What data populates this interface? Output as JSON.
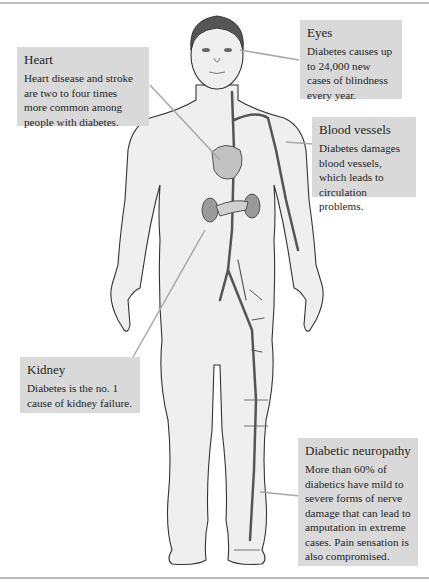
{
  "diagram": {
    "callouts": [
      {
        "id": "heart",
        "title": "Heart",
        "body": "Heart disease and stroke are two to four times more common among people with diabetes."
      },
      {
        "id": "eyes",
        "title": "Eyes",
        "body": "Diabetes causes up to 24,000 new cases of blindness every year."
      },
      {
        "id": "blood_vessels",
        "title": "Blood vessels",
        "body": "Diabetes damages blood vessels, which leads to circulation problems."
      },
      {
        "id": "kidney",
        "title": "Kidney",
        "body": "Diabetes is the no. 1 cause of kidney failure."
      },
      {
        "id": "neuropathy",
        "title": "Diabetic neuropathy",
        "body": "More than 60% of diabetics have mild to severe forms of nerve damage that can lead to amputation in extreme cases. Pain sensation is also compromised."
      }
    ],
    "colors": {
      "callout_background": "#d9d9d9",
      "body_fill": "#efefef",
      "outline": "#333333",
      "vessel": "#555555",
      "organ": "#9a9a9a",
      "leader_line": "#a8a8a8"
    }
  }
}
